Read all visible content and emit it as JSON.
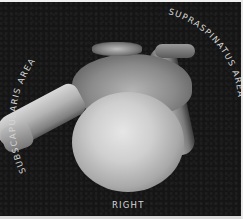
{
  "image": {
    "description": "Grayscale photograph of a right humeral head specimen with rotator cuff attachment areas labeled",
    "background_color": "#151515",
    "labels": {
      "subscapularis": "SUBSCAPULARIS AREA",
      "supraspinatus": "SUPRASPINATUS AREA",
      "side": "RIGHT"
    }
  }
}
